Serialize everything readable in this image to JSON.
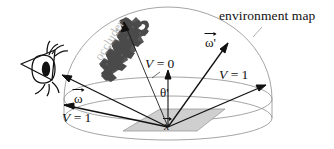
{
  "figure": {
    "labels": {
      "environment_map": "environment map",
      "occluder": "occluder",
      "v_zero": "V = 0",
      "v_one_right": "V = 1",
      "v_one_left": "V = 1",
      "theta_prime": "θ'",
      "omega": "ω",
      "omega_prime": "ω'",
      "surface_point": "x"
    },
    "colors": {
      "background": "#ffffff",
      "ink": "#111111",
      "dome_stroke": "#8d8d8d",
      "occluder_fill": "#4a4a4a",
      "occluder_text": "#bdbdbd",
      "ground_plane_fill": "#cfcfcf",
      "ground_plane_stroke": "#9a9a9a"
    },
    "elements": {
      "eye": "eye-pictogram",
      "dome": "hemisphere-dome",
      "ground": "ground-plane-parallelogram",
      "normal": "surface-normal-arrow",
      "rays": "light-direction-rays"
    }
  }
}
